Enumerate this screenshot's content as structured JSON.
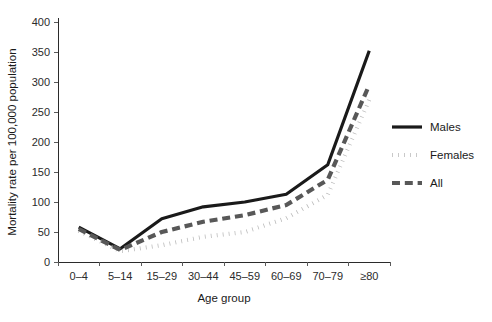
{
  "chart_data": {
    "type": "line",
    "title": "",
    "xlabel": "Age group",
    "ylabel": "Mortality rate per 100,000 population",
    "categories": [
      "0–4",
      "5–14",
      "15–29",
      "30–44",
      "45–59",
      "60–69",
      "70–79",
      "≥80"
    ],
    "ylim": [
      0,
      400
    ],
    "yticks": [
      0,
      50,
      100,
      150,
      200,
      250,
      300,
      350,
      400
    ],
    "ytick_labels": [
      "0",
      "50",
      "100",
      "150",
      "200",
      "250",
      "300",
      "350",
      "400"
    ],
    "grid": false,
    "legend_position": "right",
    "series": [
      {
        "name": "Males",
        "style": "solid",
        "color": "#1a1a1a",
        "width": 3.2,
        "values": [
          58,
          22,
          72,
          92,
          100,
          113,
          162,
          352
        ]
      },
      {
        "name": "Females",
        "style": "dotted",
        "color": "#b8b8b8",
        "width": 4.2,
        "values": [
          52,
          18,
          28,
          42,
          50,
          73,
          112,
          270
        ]
      },
      {
        "name": "All",
        "style": "dashed",
        "color": "#585858",
        "width": 4.2,
        "values": [
          55,
          20,
          50,
          67,
          78,
          95,
          137,
          295
        ]
      }
    ]
  },
  "legend": {
    "entries": [
      {
        "label": "Males"
      },
      {
        "label": "Females"
      },
      {
        "label": "All"
      }
    ]
  },
  "axes": {
    "x_title": "Age group",
    "y_title": "Mortality rate per 100,000 population"
  }
}
